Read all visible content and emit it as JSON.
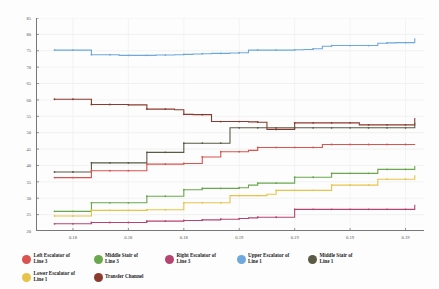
{
  "chart_data": {
    "type": "line",
    "title": "",
    "xlabel": "",
    "ylabel": "",
    "xlim": [
      0.175,
      0.196
    ],
    "ylim": [
      20,
      85
    ],
    "grid": true,
    "legend_position": "bottom",
    "x_tick_labels": [
      "0.18",
      "0.18",
      "0.18",
      "0.19",
      "0.19",
      "0.19",
      "0.19"
    ],
    "x_tick_values": [
      0.177,
      0.18,
      0.183,
      0.186,
      0.189,
      0.192,
      0.195
    ],
    "y_tick_labels": [
      "85",
      "80",
      "75",
      "70",
      "65",
      "60",
      "55",
      "50",
      "45",
      "40",
      "35",
      "30",
      "25",
      "20"
    ],
    "y_tick_values": [
      85,
      80,
      75,
      70,
      65,
      60,
      55,
      50,
      45,
      40,
      35,
      30,
      25,
      20
    ],
    "x": [
      0.176,
      0.1765,
      0.177,
      0.1775,
      0.178,
      0.1785,
      0.179,
      0.1795,
      0.18,
      0.1805,
      0.181,
      0.1815,
      0.182,
      0.1825,
      0.183,
      0.1835,
      0.184,
      0.1845,
      0.185,
      0.1855,
      0.186,
      0.1865,
      0.187,
      0.1875,
      0.188,
      0.1885,
      0.189,
      0.1895,
      0.19,
      0.1905,
      0.191,
      0.1915,
      0.192,
      0.1925,
      0.193,
      0.1935,
      0.194,
      0.1945,
      0.195,
      0.1955
    ],
    "series": [
      {
        "name": "Upper Escalator of Line 1",
        "color": "#6fa8dc",
        "values": [
          75.2,
          75.2,
          75.2,
          75.2,
          73.8,
          73.8,
          73.8,
          73.6,
          73.6,
          73.6,
          73.6,
          73.7,
          73.7,
          73.8,
          73.9,
          74.0,
          74.1,
          74.2,
          74.2,
          74.3,
          74.4,
          75.2,
          75.2,
          75.2,
          75.2,
          75.2,
          75.3,
          75.4,
          75.6,
          76.4,
          76.6,
          76.6,
          76.6,
          76.6,
          76.6,
          77.3,
          77.4,
          77.5,
          77.5,
          78.8
        ]
      },
      {
        "name": "Transfer Channel",
        "color": "#8c3a2e",
        "values": [
          60.2,
          60.2,
          60.2,
          60.2,
          58.6,
          58.6,
          58.6,
          58.6,
          58.5,
          58.5,
          57.2,
          57.2,
          57.2,
          57.0,
          55.6,
          55.5,
          55.5,
          53.4,
          53.4,
          53.4,
          53.4,
          53.3,
          53.2,
          51.0,
          51.0,
          51.0,
          53.0,
          53.0,
          53.0,
          53.0,
          53.0,
          53.0,
          53.0,
          52.4,
          52.4,
          52.4,
          52.4,
          52.4,
          52.4,
          54.5
        ]
      },
      {
        "name": "Middle Stair of Line 1",
        "color": "#5a5a46",
        "values": [
          38.0,
          38.0,
          38.0,
          38.0,
          40.8,
          40.8,
          40.8,
          40.8,
          40.8,
          40.8,
          44.0,
          44.0,
          44.0,
          44.0,
          46.8,
          46.8,
          46.8,
          46.8,
          46.8,
          51.5,
          51.5,
          51.5,
          51.5,
          51.5,
          51.5,
          51.5,
          51.5,
          51.5,
          51.5,
          51.5,
          51.5,
          51.5,
          51.5,
          51.5,
          51.5,
          51.5,
          51.5,
          51.5,
          51.5,
          53.0
        ]
      },
      {
        "name": "Left Escalator of Line 3",
        "color": "#d9534f",
        "values": [
          36.3,
          36.3,
          36.3,
          36.3,
          38.4,
          38.4,
          38.4,
          38.4,
          38.4,
          38.4,
          40.4,
          40.4,
          40.4,
          40.4,
          40.6,
          40.6,
          42.6,
          42.6,
          44.2,
          44.2,
          44.2,
          44.6,
          45.5,
          45.5,
          45.5,
          45.5,
          45.5,
          45.5,
          45.5,
          46.4,
          46.4,
          46.4,
          46.4,
          46.4,
          46.4,
          46.4,
          46.4,
          46.4,
          46.4,
          46.5
        ]
      },
      {
        "name": "Middle Stair of Line 3",
        "color": "#6aa84f",
        "values": [
          26.0,
          26.0,
          26.0,
          26.0,
          28.6,
          28.6,
          28.6,
          28.6,
          28.6,
          28.6,
          30.6,
          30.6,
          30.6,
          30.6,
          32.6,
          32.6,
          33.0,
          33.0,
          33.0,
          33.0,
          33.2,
          34.0,
          34.6,
          34.6,
          34.6,
          34.6,
          36.4,
          36.4,
          36.4,
          36.4,
          37.6,
          37.6,
          37.6,
          37.6,
          37.6,
          38.8,
          38.8,
          38.8,
          38.8,
          39.8
        ]
      },
      {
        "name": "Lower Escalator of Line 1",
        "color": "#e8c34a",
        "values": [
          24.6,
          24.6,
          24.6,
          24.6,
          26.3,
          26.3,
          26.3,
          26.3,
          26.3,
          26.3,
          26.5,
          26.5,
          26.5,
          26.5,
          28.6,
          28.6,
          28.6,
          28.6,
          28.6,
          30.8,
          30.8,
          30.8,
          30.8,
          31.2,
          32.4,
          32.4,
          32.4,
          32.4,
          32.4,
          32.4,
          34.0,
          34.0,
          34.0,
          34.0,
          34.0,
          35.8,
          35.8,
          35.8,
          35.8,
          37.0
        ]
      },
      {
        "name": "Right Escalator of Line 3",
        "color": "#b5446e",
        "values": [
          22.2,
          22.2,
          22.2,
          22.2,
          22.6,
          22.6,
          22.6,
          22.6,
          22.6,
          22.6,
          23.0,
          23.0,
          23.0,
          23.0,
          23.2,
          23.2,
          23.4,
          23.4,
          23.6,
          23.6,
          23.8,
          24.0,
          24.2,
          24.2,
          24.2,
          24.2,
          26.6,
          26.6,
          26.6,
          26.6,
          26.6,
          26.6,
          26.6,
          26.6,
          26.6,
          26.6,
          26.6,
          26.6,
          26.6,
          28.0
        ]
      }
    ]
  },
  "legend": {
    "items": [
      {
        "label": "Left Escalator of\nLine 3",
        "color": "#d9534f"
      },
      {
        "label": "Middle Stair of\nLine 3",
        "color": "#6aa84f"
      },
      {
        "label": "Right Escalator of\nLine 3",
        "color": "#b5446e"
      },
      {
        "label": "Upper Escalator of\nLine 1",
        "color": "#6fa8dc"
      },
      {
        "label": "Middle Stair of\nLine 1",
        "color": "#5a5a46"
      },
      {
        "label": "Lower Escalator of\nLine 1",
        "color": "#e8c34a"
      },
      {
        "label": "Transfer Channel",
        "color": "#8c3a2e"
      }
    ]
  }
}
